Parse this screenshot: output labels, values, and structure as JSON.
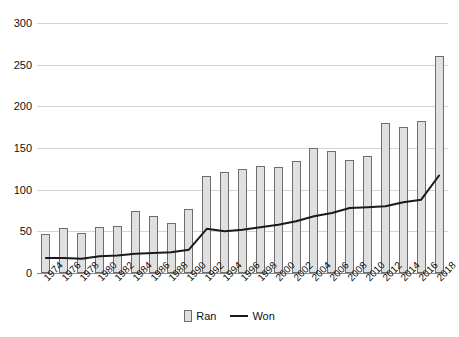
{
  "chart_data": {
    "type": "bar",
    "title": "",
    "xlabel": "",
    "ylabel": "",
    "ylim": [
      0,
      300
    ],
    "yticks": [
      0,
      50,
      100,
      150,
      200,
      250,
      300
    ],
    "grid": true,
    "legend_position": "bottom",
    "categories": [
      "1974",
      "1976",
      "1978",
      "1980",
      "1982",
      "1984",
      "1986",
      "1988",
      "1990",
      "1992",
      "1994",
      "1996",
      "1998",
      "2000",
      "2002",
      "2004",
      "2006",
      "2008",
      "2010",
      "2012",
      "2014",
      "2016",
      "2018"
    ],
    "series": [
      {
        "name": "Ran",
        "type": "bar",
        "values": [
          47,
          54,
          48,
          55,
          57,
          75,
          69,
          60,
          77,
          117,
          121,
          125,
          128,
          127,
          134,
          150,
          147,
          136,
          141,
          180,
          175,
          182,
          260
        ]
      },
      {
        "name": "Won",
        "type": "line",
        "values": [
          18,
          18,
          17,
          20,
          21,
          23,
          24,
          25,
          28,
          53,
          50,
          52,
          55,
          58,
          62,
          68,
          72,
          78,
          79,
          80,
          85,
          88,
          117
        ]
      }
    ]
  },
  "legend": {
    "entries": [
      {
        "label": "Ran",
        "marker": "bar-swatch-icon"
      },
      {
        "label": "Won",
        "marker": "line-swatch-icon"
      }
    ]
  }
}
